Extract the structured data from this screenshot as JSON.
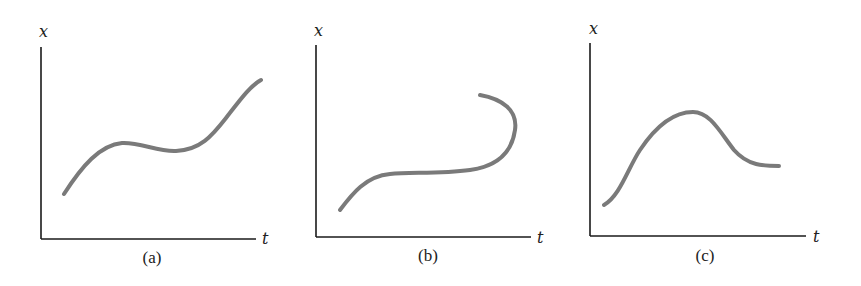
{
  "figure": {
    "panels": [
      {
        "id": "a",
        "caption": "(a)",
        "y_label": "x",
        "x_label": "t",
        "description": "Rises, small local max, slight dip, then rises steeply"
      },
      {
        "id": "b",
        "caption": "(b)",
        "y_label": "x",
        "x_label": "t",
        "description": "Rises, flattens, then curves back on itself (multi-valued in t)"
      },
      {
        "id": "c",
        "caption": "(c)",
        "y_label": "x",
        "x_label": "t",
        "description": "Rises to a maximum, then decreases and levels off"
      }
    ],
    "colors": {
      "axis": "#1a1a1a",
      "curve": "#7a7a7a",
      "background": "#ffffff"
    }
  }
}
